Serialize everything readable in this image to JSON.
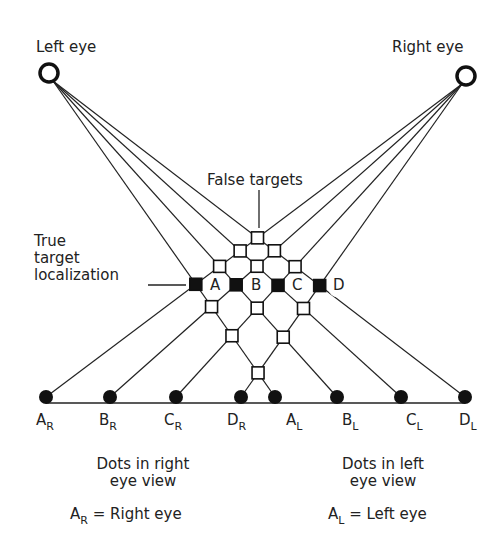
{
  "labels": {
    "left_eye": "Left eye",
    "right_eye": "Right eye",
    "false_targets": "False targets",
    "true_target_line1": "True",
    "true_target_line2": "target",
    "true_target_line3": "localization",
    "right_view_line1": "Dots in right",
    "right_view_line2": "eye view",
    "left_view_line1": "Dots in left",
    "left_view_line2": "eye view",
    "legend_right_main": "A",
    "legend_right_sub": "R",
    "legend_right_text": "= Right eye",
    "legend_left_main": "A",
    "legend_left_sub": "L",
    "legend_left_text": "= Left eye"
  },
  "targets": [
    "A",
    "B",
    "C",
    "D"
  ],
  "dots_right": [
    {
      "main": "A",
      "sub": "R"
    },
    {
      "main": "B",
      "sub": "R"
    },
    {
      "main": "C",
      "sub": "R"
    },
    {
      "main": "D",
      "sub": "R"
    }
  ],
  "dots_left": [
    {
      "main": "A",
      "sub": "L"
    },
    {
      "main": "B",
      "sub": "L"
    },
    {
      "main": "C",
      "sub": "L"
    },
    {
      "main": "D",
      "sub": "L"
    }
  ],
  "geometry": {
    "left_eye": [
      49,
      73
    ],
    "right_eye": [
      466,
      76
    ],
    "right_view_dots_x": [
      46,
      110,
      176,
      241
    ],
    "left_view_dots_x": [
      275,
      337,
      401,
      465
    ],
    "dots_y": 397
  }
}
